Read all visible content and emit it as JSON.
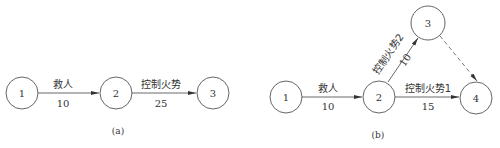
{
  "diagram_a": {
    "caption": "(a)",
    "nodes": [
      {
        "id": "1",
        "label": "1"
      },
      {
        "id": "2",
        "label": "2"
      },
      {
        "id": "3",
        "label": "3"
      }
    ],
    "edges": [
      {
        "from": "1",
        "to": "2",
        "label": "救人",
        "weight": "10",
        "style": "solid"
      },
      {
        "from": "2",
        "to": "3",
        "label": "控制火势",
        "weight": "25",
        "style": "solid"
      }
    ]
  },
  "diagram_b": {
    "caption": "(b)",
    "nodes": [
      {
        "id": "1",
        "label": "1"
      },
      {
        "id": "2",
        "label": "2"
      },
      {
        "id": "3",
        "label": "3"
      },
      {
        "id": "4",
        "label": "4"
      }
    ],
    "edges": [
      {
        "from": "1",
        "to": "2",
        "label": "救人",
        "weight": "10",
        "style": "solid"
      },
      {
        "from": "2",
        "to": "3",
        "label": "控制火势2",
        "weight": "10",
        "style": "solid"
      },
      {
        "from": "2",
        "to": "4",
        "label": "控制火势1",
        "weight": "15",
        "style": "solid"
      },
      {
        "from": "3",
        "to": "4",
        "label": "",
        "weight": "",
        "style": "dashed"
      }
    ]
  }
}
